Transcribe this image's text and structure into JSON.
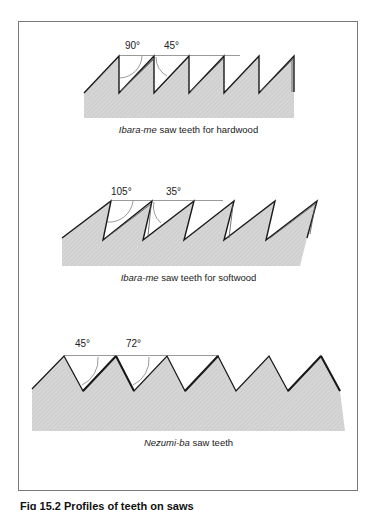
{
  "diagrams": [
    {
      "name": "hardwood",
      "caption_italic": "Ibara-me",
      "caption_rest": " saw teeth for hardwood",
      "angles": [
        "90°",
        "45°"
      ]
    },
    {
      "name": "softwood",
      "caption_italic": "Ibara-me",
      "caption_rest": " saw teeth for softwood",
      "angles": [
        "105°",
        "35°"
      ]
    },
    {
      "name": "nezumi",
      "caption_italic": "Nezumi-ba",
      "caption_rest": " saw teeth",
      "angles": [
        "45°",
        "72°"
      ]
    }
  ],
  "figure_caption": "Fig 15.2 Profiles of teeth on saws",
  "colors": {
    "fill": "#d4d4d4",
    "edge": "#1a1a1a",
    "border": "#7a7a7a"
  }
}
